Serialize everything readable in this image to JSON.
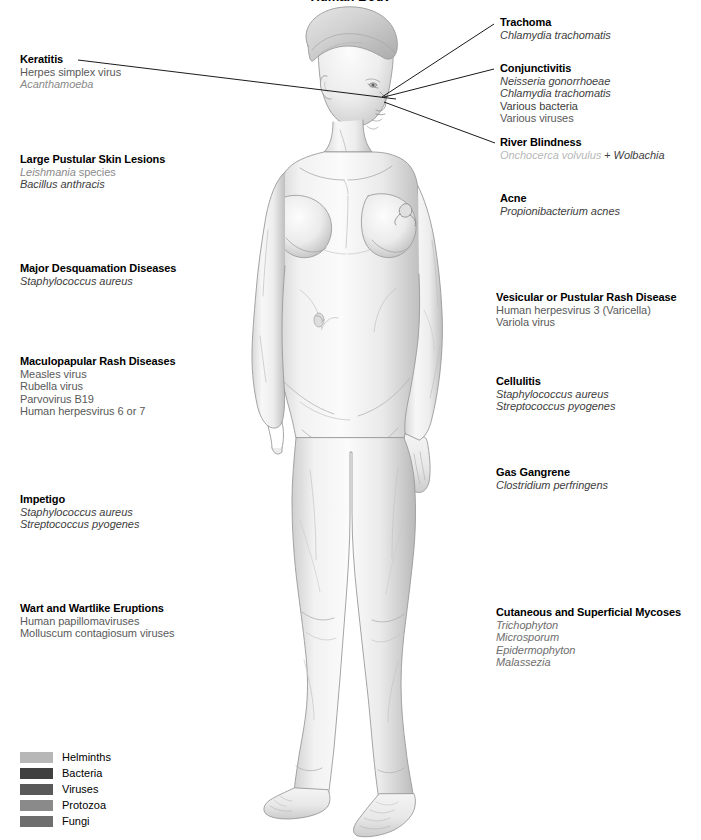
{
  "title": "Human Body",
  "legend": {
    "items": [
      {
        "label": "Helminths",
        "color": "#b7b7b7"
      },
      {
        "label": "Bacteria",
        "color": "#404040"
      },
      {
        "label": "Viruses",
        "color": "#595959"
      },
      {
        "label": "Protozoa",
        "color": "#8a8a8a"
      },
      {
        "label": "Fungi",
        "color": "#6e6e6e"
      }
    ]
  },
  "callouts": {
    "keratitis": {
      "heading": "Keratitis",
      "l1": "Herpes simplex virus",
      "l2": "Acanthamoeba"
    },
    "large_pustular": {
      "heading": "Large Pustular Skin Lesions",
      "l1a": "Leishmania",
      "l1b": " species",
      "l2": "Bacillus anthracis"
    },
    "major_desquamation": {
      "heading": "Major Desquamation Diseases",
      "l1": "Staphylococcus aureus"
    },
    "maculopapular": {
      "heading": "Maculopapular Rash Diseases",
      "l1": "Measles virus",
      "l2": "Rubella virus",
      "l3": "Parvovirus B19",
      "l4": "Human herpesvirus 6 or 7"
    },
    "impetigo": {
      "heading": "Impetigo",
      "l1": "Staphylococcus aureus",
      "l2": "Streptococcus pyogenes"
    },
    "wart": {
      "heading": "Wart and Wartlike Eruptions",
      "l1": "Human papillomaviruses",
      "l2": "Molluscum contagiosum viruses"
    },
    "trachoma": {
      "heading": "Trachoma",
      "l1": "Chlamydia trachomatis"
    },
    "conjunctivitis": {
      "heading": "Conjunctivitis",
      "l1": "Neisseria gonorrhoeae",
      "l2": "Chlamydia trachomatis",
      "l3": "Various bacteria",
      "l4": "Various viruses"
    },
    "river_blindness": {
      "heading": "River Blindness",
      "l1a": "Onchocerca volvulus",
      "l1b": " + ",
      "l1c": "Wolbachia"
    },
    "acne": {
      "heading": "Acne",
      "l1": "Propionibacterium acnes"
    },
    "vesicular": {
      "heading": "Vesicular or Pustular Rash Disease",
      "l1": "Human herpesvirus 3 (Varicella)",
      "l2": "Variola virus"
    },
    "cellulitis": {
      "heading": "Cellulitis",
      "l1": "Staphylococcus aureus",
      "l2": "Streptococcus pyogenes"
    },
    "gas_gangrene": {
      "heading": "Gas Gangrene",
      "l1": "Clostridium perfringens"
    },
    "mycoses": {
      "heading": "Cutaneous and Superficial Mycoses",
      "l1": "Trichophyton",
      "l2": "Microsporum",
      "l3": "Epidermophyton",
      "l4": "Malassezia"
    }
  }
}
